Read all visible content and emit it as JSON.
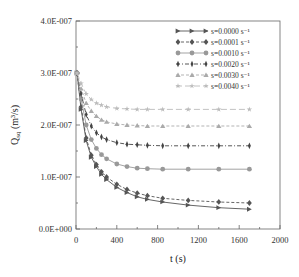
{
  "chart_data": {
    "type": "line",
    "title": "",
    "xlabel": "t (s)",
    "ylabel": "Q_sq (m³/s)",
    "ylabel_main": "Q",
    "ylabel_sub": "sq",
    "ylabel_unit": " (m³/s)",
    "xlim": [
      0,
      2000
    ],
    "ylim": [
      0,
      4e-07
    ],
    "x_ticks": [
      0,
      400,
      800,
      1200,
      1600,
      2000
    ],
    "x_tick_labels": [
      "0",
      "400",
      "800",
      "1200",
      "1600",
      "2000"
    ],
    "y_ticks": [
      0,
      1e-07,
      2e-07,
      3e-07,
      4e-07
    ],
    "y_tick_labels": [
      "0.0E+000",
      "1.0E-007",
      "2.0E-007",
      "3.0E-007",
      "4.0E-007"
    ],
    "grid": false,
    "legend_position": "upper right",
    "x": [
      10,
      50,
      100,
      150,
      200,
      250,
      300,
      400,
      500,
      600,
      700,
      850,
      1100,
      1400,
      1700
    ],
    "series": [
      {
        "name": "s=0.0000 s⁻¹",
        "marker": "triangle-right",
        "line": "solid",
        "color": "#555555",
        "values": [
          3e-07,
          2.3e-07,
          1.7e-07,
          1.38e-07,
          1.2e-07,
          1.05e-07,
          9.5e-08,
          8e-08,
          7e-08,
          6.2e-08,
          5.7e-08,
          5.2e-08,
          4.6e-08,
          4.1e-08,
          3.8e-08
        ]
      },
      {
        "name": "s=0.0001 s⁻¹",
        "marker": "diamond",
        "line": "dashed",
        "color": "#555555",
        "values": [
          3e-07,
          2.35e-07,
          1.75e-07,
          1.42e-07,
          1.24e-07,
          1.1e-07,
          1e-07,
          8.6e-08,
          7.6e-08,
          6.9e-08,
          6.4e-08,
          5.9e-08,
          5.5e-08,
          5.2e-08,
          5e-08
        ]
      },
      {
        "name": "s=0.0010 s⁻¹",
        "marker": "circle",
        "line": "solid",
        "color": "#999999",
        "values": [
          3e-07,
          2.5e-07,
          2e-07,
          1.72e-07,
          1.55e-07,
          1.43e-07,
          1.35e-07,
          1.25e-07,
          1.2e-07,
          1.17e-07,
          1.16e-07,
          1.15e-07,
          1.15e-07,
          1.15e-07,
          1.15e-07
        ]
      },
      {
        "name": "s=0.0020 s⁻¹",
        "marker": "thin-diamond",
        "line": "dash-dot",
        "color": "#444444",
        "values": [
          3e-07,
          2.6e-07,
          2.2e-07,
          1.98e-07,
          1.85e-07,
          1.77e-07,
          1.72e-07,
          1.66e-07,
          1.63e-07,
          1.62e-07,
          1.61e-07,
          1.6e-07,
          1.6e-07,
          1.6e-07,
          1.6e-07
        ]
      },
      {
        "name": "s=0.0030 s⁻¹",
        "marker": "triangle-up",
        "line": "dashed",
        "color": "#aaaaaa",
        "values": [
          3e-07,
          2.7e-07,
          2.42e-07,
          2.27e-07,
          2.17e-07,
          2.1e-07,
          2.06e-07,
          2.02e-07,
          2e-07,
          1.99e-07,
          1.98e-07,
          1.98e-07,
          1.98e-07,
          1.98e-07,
          1.98e-07
        ]
      },
      {
        "name": "s=0.0040 s⁻¹",
        "marker": "star",
        "line": "solid-dashed",
        "color": "#bbbbbb",
        "values": [
          3e-07,
          2.8e-07,
          2.6e-07,
          2.49e-07,
          2.42e-07,
          2.38e-07,
          2.35e-07,
          2.32e-07,
          2.31e-07,
          2.3e-07,
          2.3e-07,
          2.3e-07,
          2.3e-07,
          2.3e-07,
          2.3e-07
        ]
      }
    ]
  },
  "legend": {
    "items": [
      {
        "label": "s=0.0000 s⁻¹"
      },
      {
        "label": "s=0.0001 s⁻¹"
      },
      {
        "label": "s=0.0010 s⁻¹"
      },
      {
        "label": "s=0.0020 s⁻¹"
      },
      {
        "label": "s=0.0030 s⁻¹"
      },
      {
        "label": "s=0.0040 s⁻¹"
      }
    ]
  },
  "axes": {
    "x_title": "t (s)",
    "y_title_main": "Q",
    "y_title_sub": "sq",
    "y_title_unit": " (m³/s)"
  }
}
